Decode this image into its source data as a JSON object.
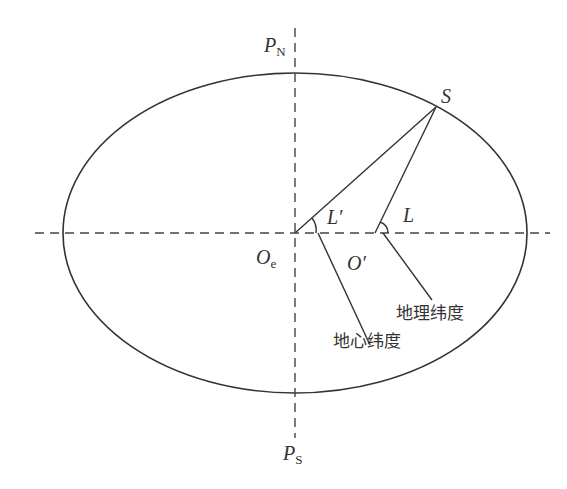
{
  "diagram": {
    "title": "",
    "colors": {
      "stroke": "#333333",
      "background": "#ffffff"
    },
    "ellipse": {
      "cx": 295,
      "cy": 233,
      "rx": 232,
      "ry": 160
    },
    "axes": {
      "horizontal": {
        "x1": 35,
        "x2": 550,
        "y": 233,
        "style": "dashed"
      },
      "vertical": {
        "x": 295,
        "y1": 28,
        "y2": 438,
        "style": "dashed"
      }
    },
    "points": {
      "S": {
        "x": 436,
        "y": 107
      },
      "Oe": {
        "x": 295,
        "y": 233
      }
    },
    "labels": {
      "pn_main": "P",
      "pn_sub": "N",
      "ps_main": "P",
      "ps_sub": "S",
      "s": "S",
      "oe_main": "O",
      "oe_sub": "e",
      "o_prime": "O′",
      "l_prime": "L′",
      "l": "L",
      "geographic_latitude": "地理纬度",
      "geocentric_latitude": "地心纬度"
    },
    "lines": [
      {
        "name": "geocentric-radius",
        "from": "Oe",
        "to": "S"
      },
      {
        "name": "normal-line",
        "from": "S",
        "to": [
          375,
          233
        ]
      },
      {
        "name": "geocentric-leader",
        "from": [
          318,
          233
        ],
        "to": [
          370,
          345
        ]
      },
      {
        "name": "geographic-leader",
        "from": [
          383,
          233
        ],
        "to": [
          432,
          300
        ]
      }
    ]
  }
}
